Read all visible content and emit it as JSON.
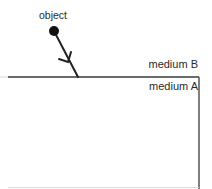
{
  "diagram": {
    "labels": {
      "object": "object",
      "medium_b": "medium B",
      "medium_a": "medium A"
    },
    "elements": {
      "object_marker": {
        "shape": "filled-circle",
        "cx": 54,
        "cy": 31,
        "r": 5,
        "color": "#111111"
      },
      "ray": {
        "from": [
          54,
          31
        ],
        "to": [
          78,
          77
        ],
        "direction": "toward-boundary",
        "color": "#222222"
      },
      "boundary": {
        "y": 77,
        "x_start": 8,
        "x_end": 199,
        "color": "#333333"
      },
      "medium_a_box": {
        "left": 8,
        "top": 77,
        "right": 199,
        "bottom": 187
      }
    },
    "colors": {
      "background": "#ffffff",
      "stroke": "#222222",
      "text": "#2a2a2a"
    }
  }
}
